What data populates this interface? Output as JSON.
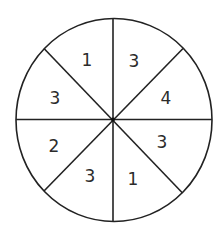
{
  "diagram": {
    "type": "spinner",
    "sector_count": 8,
    "colors": {
      "line": "#222222",
      "text": "#2b2b2b",
      "background": "#ffffff"
    },
    "sectors": [
      {
        "position": "top-right",
        "value": "3"
      },
      {
        "position": "right-upper",
        "value": "4"
      },
      {
        "position": "right-lower",
        "value": "3"
      },
      {
        "position": "bottom-right",
        "value": "1"
      },
      {
        "position": "bottom-left",
        "value": "3"
      },
      {
        "position": "left-lower",
        "value": "2"
      },
      {
        "position": "left-upper",
        "value": "3"
      },
      {
        "position": "top-left",
        "value": "1"
      }
    ]
  }
}
